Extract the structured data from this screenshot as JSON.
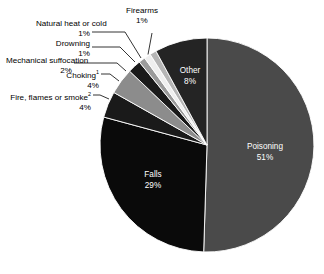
{
  "chart_data": {
    "type": "pie",
    "title": "",
    "subtitle": "",
    "xlabel": "",
    "ylabel": "",
    "legend_position": "none",
    "grid": false,
    "unit": "%",
    "categories": [
      "Poisoning",
      "Falls",
      "Fire, flames or smoke",
      "Choking",
      "Mechanical suffocation",
      "Drowning",
      "Natural heat or cold",
      "Firearms",
      "Other"
    ],
    "values": [
      51,
      29,
      4,
      4,
      2,
      1,
      1,
      1,
      8
    ],
    "slices": [
      {
        "label": "Poisoning",
        "value": 51,
        "value_text": "51%",
        "color": "#4a4a4a",
        "label_placement": "inside",
        "label_color": "#ffffff"
      },
      {
        "label": "Falls",
        "value": 29,
        "value_text": "29%",
        "color": "#0a0a0a",
        "label_placement": "inside",
        "label_color": "#ffffff"
      },
      {
        "label": "Fire, flames or smoke",
        "footnote_marker": "2",
        "value": 4,
        "value_text": "4%",
        "color": "#1a1a1a",
        "label_placement": "callout",
        "label_color": "#000000"
      },
      {
        "label": "Choking",
        "footnote_marker": "1",
        "value": 4,
        "value_text": "4%",
        "color": "#8c8c8c",
        "label_placement": "callout",
        "label_color": "#000000"
      },
      {
        "label": "Mechanical suffocation",
        "value": 2,
        "value_text": "2%",
        "color": "#1a1a1a",
        "label_placement": "callout",
        "label_color": "#000000"
      },
      {
        "label": "Drowning",
        "value": 1,
        "value_text": "1%",
        "color": "#9a9a9a",
        "label_placement": "callout",
        "label_color": "#000000"
      },
      {
        "label": "Natural heat or cold",
        "value": 1,
        "value_text": "1%",
        "color": "#efefef",
        "label_placement": "callout",
        "label_color": "#000000"
      },
      {
        "label": "Firearms",
        "value": 1,
        "value_text": "1%",
        "color": "#b5b5b5",
        "label_placement": "callout",
        "label_color": "#000000"
      },
      {
        "label": "Other",
        "value": 8,
        "value_text": "8%",
        "color": "#242424",
        "label_placement": "inside",
        "label_color": "#ffffff"
      }
    ]
  },
  "labels": {
    "poisoning": {
      "name": "Poisoning",
      "pct": "51%"
    },
    "falls": {
      "name": "Falls",
      "pct": "29%"
    },
    "other": {
      "name": "Other",
      "pct": "8%"
    },
    "fire": {
      "name": "Fire, flames or smoke",
      "marker": "2",
      "pct": "4%"
    },
    "choking": {
      "name": "Choking",
      "marker": "1",
      "pct": "4%"
    },
    "mechanical": {
      "name": "Mechanical suffocation",
      "pct": "2%"
    },
    "drowning": {
      "name": "Drowning",
      "pct": "1%"
    },
    "natural": {
      "name": "Natural heat or cold",
      "pct": "1%"
    },
    "firearms": {
      "name": "Firearms",
      "pct": "1%"
    }
  },
  "colors": {
    "background": "#ffffff",
    "text": "#000000",
    "slice_border": "#ffffff"
  }
}
